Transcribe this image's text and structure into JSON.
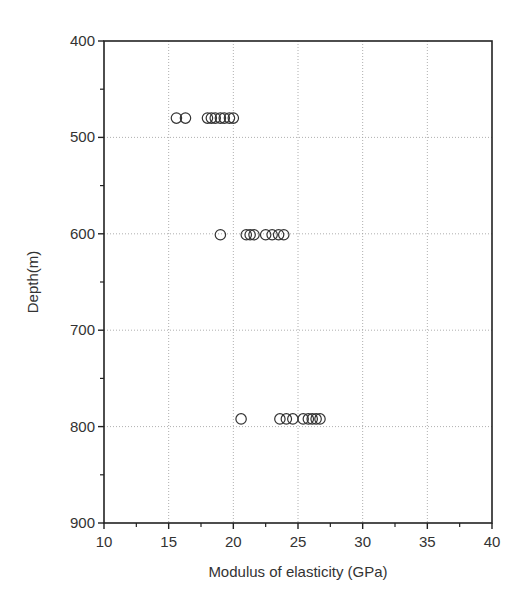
{
  "chart_data": {
    "type": "scatter",
    "title": "",
    "xlabel": "Modulus of elasticity (GPa)",
    "ylabel": "Depth(m)",
    "xlim": [
      10,
      40
    ],
    "ylim": [
      900,
      400
    ],
    "y_inverted": true,
    "xticks": [
      10,
      15,
      20,
      25,
      30,
      35,
      40
    ],
    "yticks": [
      400,
      500,
      600,
      700,
      800,
      900
    ],
    "grid": true,
    "grid_style": "dotted",
    "marker": "open-circle",
    "legend": null,
    "series": [
      {
        "name": "Depth ~480 m",
        "x": [
          15.6,
          16.3,
          18.0,
          18.3,
          18.6,
          19.0,
          19.3,
          19.7,
          20.0
        ],
        "y": [
          480,
          480,
          480,
          480,
          480,
          480,
          480,
          480,
          480
        ]
      },
      {
        "name": "Depth ~601 m",
        "x": [
          19.0,
          21.0,
          21.3,
          21.6,
          22.5,
          23.0,
          23.5,
          23.9
        ],
        "y": [
          601,
          601,
          601,
          601,
          601,
          601,
          601,
          601
        ]
      },
      {
        "name": "Depth ~792 m",
        "x": [
          20.6,
          23.6,
          24.1,
          24.6,
          25.4,
          25.8,
          26.1,
          26.4,
          26.7
        ],
        "y": [
          792,
          792,
          792,
          792,
          792,
          792,
          792,
          792,
          792
        ]
      }
    ]
  },
  "colors": {
    "axis": "#222222",
    "grid": "#9a9a9a",
    "marker": "#333333",
    "text": "#333333"
  }
}
